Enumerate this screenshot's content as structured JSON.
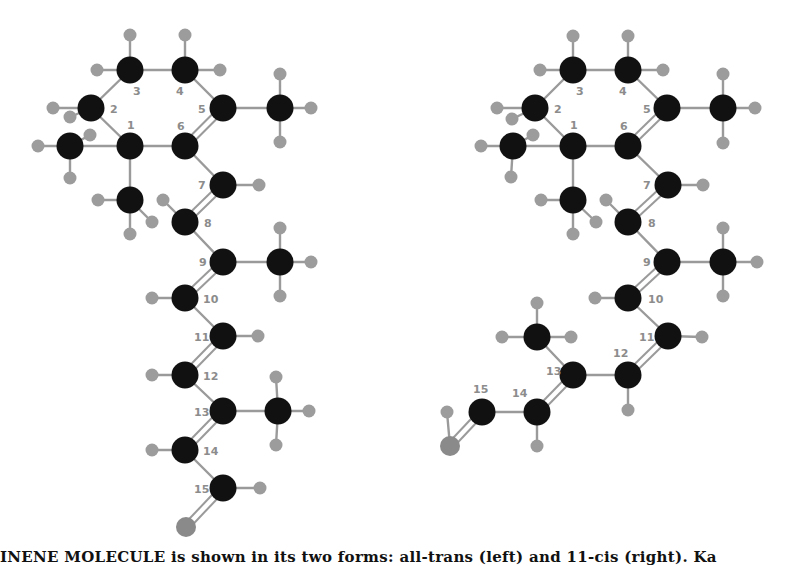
{
  "figure": {
    "caption": "INENE MOLECULE is shown in its two forms: all-trans (left) and 11-cis (right). Ka",
    "colors": {
      "carbon": "#111111",
      "hydrogen": "#9c9c9c",
      "oxygen": "#8a8a8a",
      "bond": "#9a9a9a",
      "label": "#8c8c8c"
    }
  },
  "molecules": [
    {
      "name": "all-trans-retinal",
      "carbons": [
        {
          "id": "C1",
          "label": "1",
          "x": 130,
          "y": 146,
          "lx": 127,
          "ly": 129
        },
        {
          "id": "C2",
          "label": "2",
          "x": 91,
          "y": 108,
          "lx": 110,
          "ly": 113
        },
        {
          "id": "C3",
          "label": "3",
          "x": 130,
          "y": 70,
          "lx": 133,
          "ly": 95
        },
        {
          "id": "C4",
          "label": "4",
          "x": 185,
          "y": 70,
          "lx": 176,
          "ly": 95
        },
        {
          "id": "C5",
          "label": "5",
          "x": 223,
          "y": 108,
          "lx": 198,
          "ly": 113
        },
        {
          "id": "C6",
          "label": "6",
          "x": 185,
          "y": 146,
          "lx": 177,
          "ly": 130
        },
        {
          "id": "C7",
          "label": "7",
          "x": 223,
          "y": 185,
          "lx": 198,
          "ly": 189
        },
        {
          "id": "C8",
          "label": "8",
          "x": 185,
          "y": 222,
          "lx": 204,
          "ly": 227
        },
        {
          "id": "C9",
          "label": "9",
          "x": 223,
          "y": 262,
          "lx": 199,
          "ly": 266
        },
        {
          "id": "C10",
          "label": "10",
          "x": 185,
          "y": 298,
          "lx": 203,
          "ly": 303
        },
        {
          "id": "C11",
          "label": "11",
          "x": 223,
          "y": 336,
          "lx": 194,
          "ly": 341
        },
        {
          "id": "C12",
          "label": "12",
          "x": 185,
          "y": 375,
          "lx": 203,
          "ly": 380
        },
        {
          "id": "C13",
          "label": "13",
          "x": 223,
          "y": 411,
          "lx": 194,
          "ly": 416
        },
        {
          "id": "C14",
          "label": "14",
          "x": 185,
          "y": 450,
          "lx": 203,
          "ly": 455
        },
        {
          "id": "C15",
          "label": "15",
          "x": 223,
          "y": 488,
          "lx": 194,
          "ly": 493
        },
        {
          "id": "M1a",
          "label": "",
          "x": 70,
          "y": 146
        },
        {
          "id": "M1b",
          "label": "",
          "x": 130,
          "y": 200
        },
        {
          "id": "M5",
          "label": "",
          "x": 280,
          "y": 108
        },
        {
          "id": "M9",
          "label": "",
          "x": 280,
          "y": 262
        },
        {
          "id": "M13",
          "label": "",
          "x": 278,
          "y": 411
        }
      ],
      "oxygen": {
        "x": 186,
        "y": 527
      },
      "hydrogens": [
        [
          130,
          35
        ],
        [
          97,
          70
        ],
        [
          185,
          35
        ],
        [
          220,
          70
        ],
        [
          53,
          108
        ],
        [
          90,
          135
        ],
        [
          38,
          146
        ],
        [
          70,
          117
        ],
        [
          70,
          178
        ],
        [
          98,
          200
        ],
        [
          163,
          200
        ],
        [
          130,
          234
        ],
        [
          280,
          74
        ],
        [
          311,
          108
        ],
        [
          280,
          142
        ],
        [
          259,
          185
        ],
        [
          152,
          222
        ],
        [
          280,
          228
        ],
        [
          311,
          262
        ],
        [
          280,
          296
        ],
        [
          152,
          298
        ],
        [
          258,
          336
        ],
        [
          152,
          375
        ],
        [
          276,
          377
        ],
        [
          309,
          411
        ],
        [
          276,
          445
        ],
        [
          152,
          450
        ],
        [
          260,
          488
        ]
      ],
      "bonds": [
        [
          "C1",
          "C2",
          1
        ],
        [
          "C2",
          "C3",
          1
        ],
        [
          "C3",
          "C4",
          1
        ],
        [
          "C4",
          "C5",
          1
        ],
        [
          "C5",
          "C6",
          2
        ],
        [
          "C6",
          "C1",
          1
        ],
        [
          "C1",
          "M1a",
          1
        ],
        [
          "C1",
          "M1b",
          1
        ],
        [
          "C5",
          "M5",
          1
        ],
        [
          "C6",
          "C7",
          1
        ],
        [
          "C7",
          "C8",
          2
        ],
        [
          "C8",
          "C9",
          1
        ],
        [
          "C9",
          "C10",
          2
        ],
        [
          "C9",
          "M9",
          1
        ],
        [
          "C10",
          "C11",
          1
        ],
        [
          "C11",
          "C12",
          2
        ],
        [
          "C12",
          "C13",
          1
        ],
        [
          "C13",
          "C14",
          2
        ],
        [
          "C13",
          "M13",
          1
        ],
        [
          "C14",
          "C15",
          1
        ],
        [
          "C15",
          "O",
          2
        ]
      ]
    },
    {
      "name": "11-cis-retinal",
      "carbons": [
        {
          "id": "C1",
          "label": "1",
          "x": 573,
          "y": 146,
          "lx": 570,
          "ly": 129
        },
        {
          "id": "C2",
          "label": "2",
          "x": 535,
          "y": 108,
          "lx": 554,
          "ly": 113
        },
        {
          "id": "C3",
          "label": "3",
          "x": 573,
          "y": 70,
          "lx": 576,
          "ly": 95
        },
        {
          "id": "C4",
          "label": "4",
          "x": 628,
          "y": 70,
          "lx": 619,
          "ly": 95
        },
        {
          "id": "C5",
          "label": "5",
          "x": 667,
          "y": 108,
          "lx": 643,
          "ly": 113
        },
        {
          "id": "C6",
          "label": "6",
          "x": 628,
          "y": 146,
          "lx": 620,
          "ly": 130
        },
        {
          "id": "C7",
          "label": "7",
          "x": 668,
          "y": 185,
          "lx": 643,
          "ly": 189
        },
        {
          "id": "C8",
          "label": "8",
          "x": 628,
          "y": 222,
          "lx": 648,
          "ly": 227
        },
        {
          "id": "C9",
          "label": "9",
          "x": 667,
          "y": 262,
          "lx": 643,
          "ly": 266
        },
        {
          "id": "C10",
          "label": "10",
          "x": 628,
          "y": 298,
          "lx": 648,
          "ly": 303
        },
        {
          "id": "C11",
          "label": "11",
          "x": 668,
          "y": 336,
          "lx": 639,
          "ly": 341
        },
        {
          "id": "C12",
          "label": "12",
          "x": 628,
          "y": 375,
          "lx": 613,
          "ly": 357
        },
        {
          "id": "C13",
          "label": "13",
          "x": 573,
          "y": 375,
          "lx": 546,
          "ly": 375
        },
        {
          "id": "C14",
          "label": "14",
          "x": 537,
          "y": 412,
          "lx": 512,
          "ly": 397
        },
        {
          "id": "C15",
          "label": "15",
          "x": 482,
          "y": 412,
          "lx": 473,
          "ly": 393
        },
        {
          "id": "M1a",
          "label": "",
          "x": 513,
          "y": 146
        },
        {
          "id": "M1b",
          "label": "",
          "x": 573,
          "y": 200
        },
        {
          "id": "M5",
          "label": "",
          "x": 723,
          "y": 108
        },
        {
          "id": "M9",
          "label": "",
          "x": 723,
          "y": 262
        },
        {
          "id": "M13",
          "label": "",
          "x": 537,
          "y": 337
        }
      ],
      "oxygen": {
        "x": 450,
        "y": 446
      },
      "hydrogens": [
        [
          573,
          36
        ],
        [
          540,
          70
        ],
        [
          628,
          36
        ],
        [
          663,
          70
        ],
        [
          497,
          108
        ],
        [
          533,
          135
        ],
        [
          481,
          146
        ],
        [
          512,
          119
        ],
        [
          511,
          177
        ],
        [
          541,
          200
        ],
        [
          606,
          200
        ],
        [
          573,
          234
        ],
        [
          723,
          74
        ],
        [
          755,
          108
        ],
        [
          723,
          143
        ],
        [
          703,
          185
        ],
        [
          596,
          222
        ],
        [
          723,
          228
        ],
        [
          757,
          262
        ],
        [
          723,
          296
        ],
        [
          595,
          298
        ],
        [
          702,
          337
        ],
        [
          628,
          410
        ],
        [
          537,
          303
        ],
        [
          502,
          337
        ],
        [
          571,
          337
        ],
        [
          537,
          446
        ],
        [
          447,
          412
        ]
      ],
      "bonds": [
        [
          "C1",
          "C2",
          1
        ],
        [
          "C2",
          "C3",
          1
        ],
        [
          "C3",
          "C4",
          1
        ],
        [
          "C4",
          "C5",
          1
        ],
        [
          "C5",
          "C6",
          2
        ],
        [
          "C6",
          "C1",
          1
        ],
        [
          "C1",
          "M1a",
          1
        ],
        [
          "C1",
          "M1b",
          1
        ],
        [
          "C5",
          "M5",
          1
        ],
        [
          "C6",
          "C7",
          1
        ],
        [
          "C7",
          "C8",
          2
        ],
        [
          "C8",
          "C9",
          1
        ],
        [
          "C9",
          "C10",
          2
        ],
        [
          "C9",
          "M9",
          1
        ],
        [
          "C10",
          "C11",
          1
        ],
        [
          "C11",
          "C12",
          2
        ],
        [
          "C12",
          "C13",
          1
        ],
        [
          "C13",
          "C14",
          2
        ],
        [
          "C13",
          "M13",
          1
        ],
        [
          "C14",
          "C15",
          1
        ],
        [
          "C15",
          "O",
          2
        ]
      ]
    }
  ]
}
